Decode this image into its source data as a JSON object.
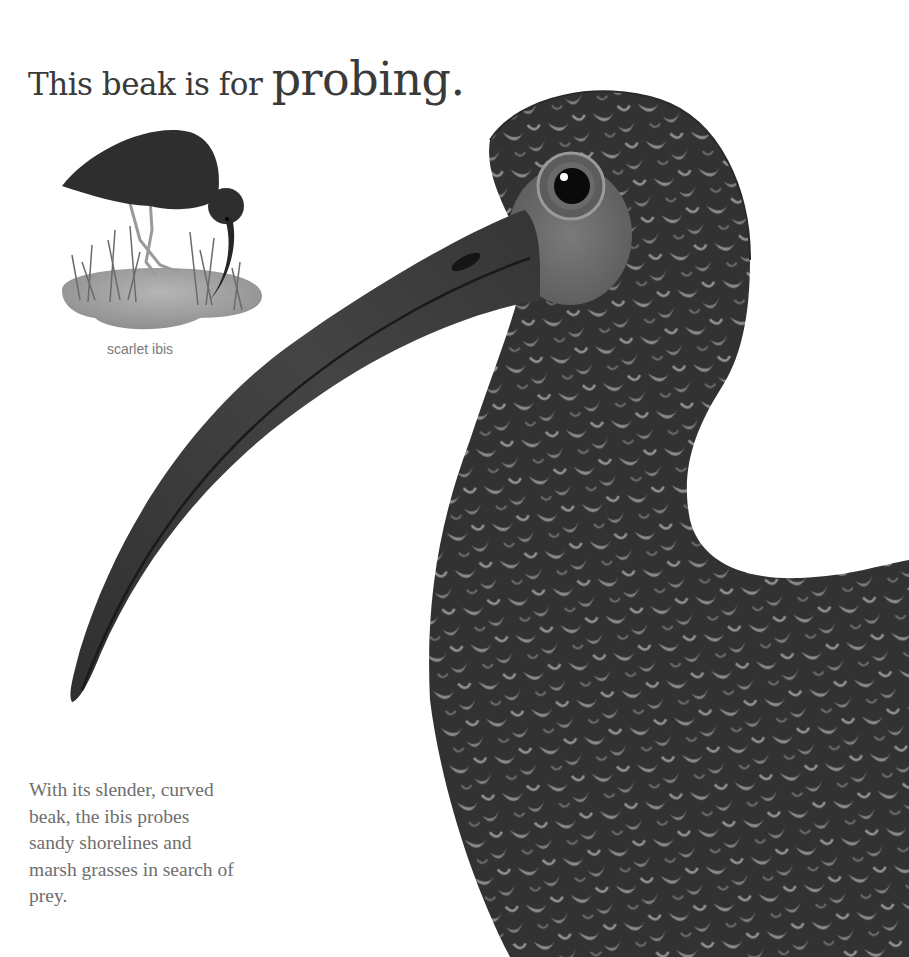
{
  "page": {
    "headline": {
      "lead": "This beak is for ",
      "emphasis": "probing."
    },
    "inset": {
      "caption": "scarlet ibis"
    },
    "body_text": "With its slender, curved beak, the ibis probes sandy shorelines and marsh grasses in search of prey.",
    "colors": {
      "background": "#ffffff",
      "headline": "#3a3a3a",
      "caption": "#7a7a7a",
      "body_text": "#6e6e6e",
      "plumage_dark": "#2e2e2e",
      "plumage_light": "#8a8a8a",
      "beak": "#3b3b3b",
      "water": "#9a9a9a"
    }
  }
}
